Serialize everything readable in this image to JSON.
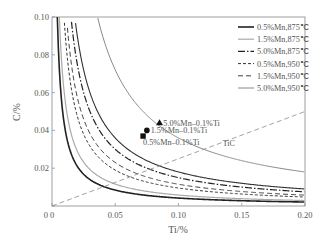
{
  "chart_data": {
    "type": "line",
    "title": "",
    "xlabel": "Ti/%",
    "ylabel": "C/%",
    "xlim": [
      0,
      0.2
    ],
    "ylim": [
      0,
      0.1
    ],
    "xticks": [
      {
        "v": 0,
        "label": "0"
      },
      {
        "v": 0.05,
        "label": "0.05"
      },
      {
        "v": 0.1,
        "label": "0.10"
      },
      {
        "v": 0.15,
        "label": "0.15"
      },
      {
        "v": 0.2,
        "label": "0.20"
      }
    ],
    "yticks": [
      {
        "v": 0,
        "label": "0"
      },
      {
        "v": 0.02,
        "label": "0.02"
      },
      {
        "v": 0.04,
        "label": "0.04"
      },
      {
        "v": 0.06,
        "label": "0.06"
      },
      {
        "v": 0.08,
        "label": "0.08"
      },
      {
        "v": 0.1,
        "label": "0.10"
      }
    ],
    "legend_position": "top-right",
    "series": [
      {
        "name": "0.5%Mn,875℃",
        "product_C_Ti": 0.00042,
        "style": "solid",
        "color": "#222222",
        "width": 1.6
      },
      {
        "name": "1.5%Mn,875℃",
        "product_C_Ti": 0.00058,
        "style": "solid",
        "color": "#aaaaaa",
        "width": 1.2
      },
      {
        "name": "5.0%Mn,875℃",
        "product_C_Ti": 0.0015,
        "style": "dashdot",
        "color": "#222222",
        "width": 1.2
      },
      {
        "name": "0.5%Mn,950℃",
        "product_C_Ti": 0.00095,
        "style": "dotted-dash",
        "color": "#333333",
        "width": 1.0
      },
      {
        "name": "1.5%Mn,950℃",
        "product_C_Ti": 0.00115,
        "style": "dashed",
        "color": "#444444",
        "width": 1.0
      },
      {
        "name": "5.0%Mn,950℃",
        "product_C_Ti": 0.0036,
        "style": "solid",
        "color": "#888888",
        "width": 1.0
      }
    ],
    "extra_solid_curve": {
      "product_C_Ti": 0.0018,
      "color": "#333333"
    },
    "tic_line": {
      "label": "TiC",
      "points": [
        [
          0,
          0
        ],
        [
          0.2,
          0.05
        ]
      ],
      "style": "dashed",
      "color": "#999999"
    },
    "points": [
      {
        "label": "5.0%Mn–0.1%Ti",
        "x": 0.085,
        "y": 0.044,
        "marker": "triangle"
      },
      {
        "label": "1.5%Mn–0.1%Ti",
        "x": 0.075,
        "y": 0.04,
        "marker": "circle"
      },
      {
        "label": "0.5%Mn–0.1%Ti",
        "x": 0.072,
        "y": 0.037,
        "marker": "square"
      }
    ]
  }
}
